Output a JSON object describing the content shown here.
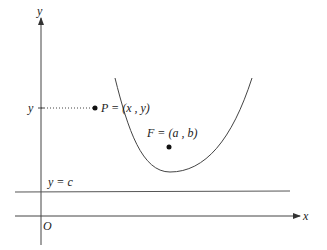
{
  "diagram": {
    "type": "parabola-focus-directrix",
    "axes": {
      "x_label": "x",
      "y_label": "y",
      "origin_label": "O"
    },
    "directrix": {
      "label": "y = c"
    },
    "point_p": {
      "label": "P = (x , y)",
      "y_tick_label": "y"
    },
    "focus": {
      "label": "F = (a , b)"
    },
    "colors": {
      "stroke": "#333333",
      "text": "#222222",
      "background": "#ffffff"
    }
  }
}
